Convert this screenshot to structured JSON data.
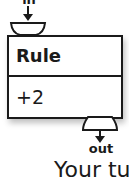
{
  "diagram": {
    "input_port": {
      "label": "in"
    },
    "rule_block": {
      "title": "Rule",
      "value": "+2"
    },
    "output_port": {
      "label": "out"
    },
    "caption": "Your tu"
  }
}
